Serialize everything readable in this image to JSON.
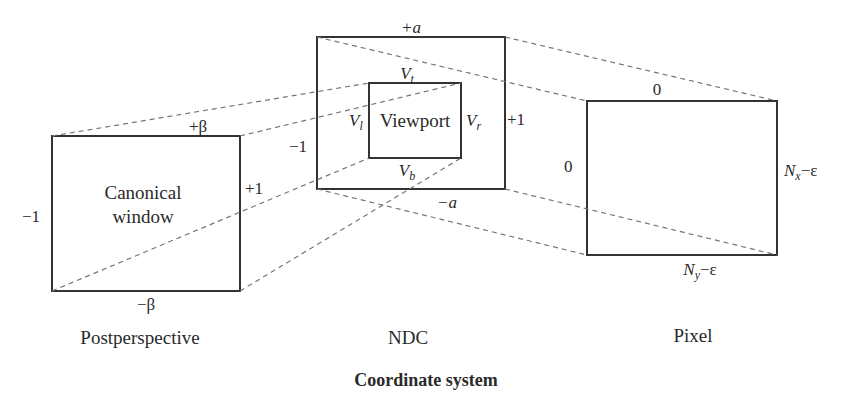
{
  "title": "Coordinate system",
  "panels": {
    "postperspective": {
      "caption": "Postperspective",
      "box_label_line1": "Canonical",
      "box_label_line2": "window",
      "top": "+β",
      "bottom": "−β",
      "left": "−1",
      "right": "+1"
    },
    "ndc": {
      "caption": "NDC",
      "top": "+a",
      "bottom": "−a",
      "left": "−1",
      "right": "+1",
      "viewport": {
        "label": "Viewport",
        "top_base": "V",
        "top_sub": "t",
        "bottom_base": "V",
        "bottom_sub": "b",
        "left_base": "V",
        "left_sub": "l",
        "right_base": "V",
        "right_sub": "r"
      }
    },
    "pixel": {
      "caption": "Pixel",
      "top": "0",
      "left": "0",
      "right_base": "N",
      "right_sub": "x",
      "right_suffix": "−ε",
      "bottom_base": "N",
      "bottom_sub": "y",
      "bottom_suffix": "−ε"
    }
  },
  "colors": {
    "solid": "#333333",
    "dashed": "#777777"
  }
}
